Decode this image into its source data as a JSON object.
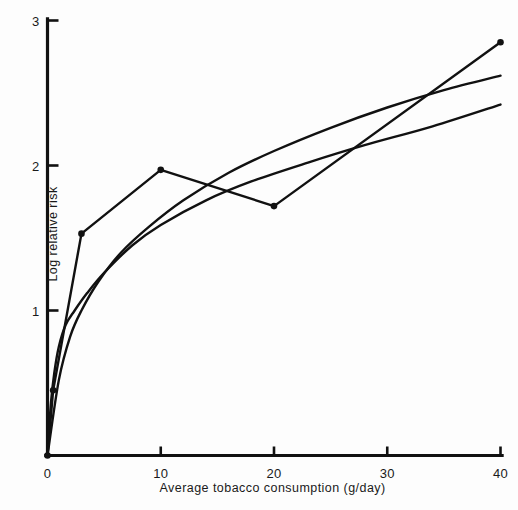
{
  "chart_data": {
    "type": "line",
    "title": "",
    "xlabel": "Average tobacco consumption (g/day)",
    "ylabel": "Log relative risk",
    "xlim": [
      0,
      40
    ],
    "ylim": [
      0,
      3
    ],
    "xticks": [
      0,
      10,
      20,
      30,
      40
    ],
    "xtick_labels": [
      "0",
      "10",
      "20",
      "30",
      "40"
    ],
    "yticks": [
      1,
      2,
      3
    ],
    "ytick_labels": [
      "1",
      "2",
      "3"
    ],
    "grid": false,
    "legend": null,
    "legend_position": "none",
    "series": [
      {
        "name": "observed-points",
        "style": "polyline-with-markers",
        "markers": true,
        "x": [
          0,
          0.5,
          3,
          10,
          20,
          40
        ],
        "y": [
          0,
          0.45,
          1.53,
          1.97,
          1.72,
          2.85
        ]
      },
      {
        "name": "logarithmic-fit",
        "style": "smooth-curve",
        "markers": false,
        "x": [
          0,
          0.3,
          0.6,
          1,
          1.6,
          2.4,
          3.5,
          5,
          7.5,
          10,
          14,
          18,
          23,
          28,
          34,
          40
        ],
        "y": [
          0,
          0.36,
          0.57,
          0.75,
          0.9,
          1.0,
          1.12,
          1.26,
          1.45,
          1.59,
          1.76,
          1.89,
          2.02,
          2.14,
          2.27,
          2.42
        ]
      },
      {
        "name": "quadratic-fit",
        "style": "smooth-curve",
        "markers": false,
        "x": [
          0,
          1,
          2,
          3,
          4.5,
          6.5,
          9,
          12,
          16,
          20,
          25,
          30,
          35,
          40
        ],
        "y": [
          0,
          0.52,
          0.82,
          1.0,
          1.2,
          1.4,
          1.58,
          1.76,
          1.95,
          2.1,
          2.26,
          2.4,
          2.52,
          2.62
        ]
      }
    ]
  },
  "axes": {
    "x_axis_name": "x-axis",
    "y_axis_name": "y-axis"
  }
}
